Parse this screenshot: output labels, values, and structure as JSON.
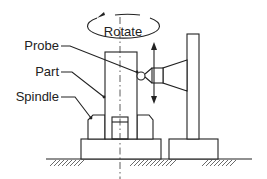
{
  "diagram": {
    "type": "mechanical-schematic",
    "labels": {
      "rotate": "Rotate",
      "probe": "Probe",
      "part": "Part",
      "spindle": "Spindle"
    },
    "annotations": {
      "rotation_arrow": "rotation about vertical axis",
      "vertical_travel_arrow": "probe vertical travel (up/down)"
    },
    "colors": {
      "line": "#222222",
      "background": "#ffffff"
    }
  }
}
